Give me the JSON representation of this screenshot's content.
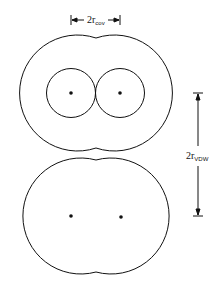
{
  "diagram": {
    "labels": {
      "cov_prefix": "2r",
      "cov_sub": "cov",
      "vdw_prefix": "2r",
      "vdw_sub": "VDW"
    },
    "molecules": [
      {
        "name": "top-molecule",
        "atoms": [
          {
            "x": 71,
            "y": 93
          },
          {
            "x": 120,
            "y": 93
          }
        ],
        "vdw_radius": 58,
        "cov_radius": 24.5
      },
      {
        "name": "bottom-molecule",
        "atoms": [
          {
            "x": 71,
            "y": 216
          },
          {
            "x": 121,
            "y": 216
          }
        ],
        "vdw_radius": 58
      }
    ],
    "colors": {
      "stroke": "#111111",
      "background": "#ffffff"
    }
  }
}
